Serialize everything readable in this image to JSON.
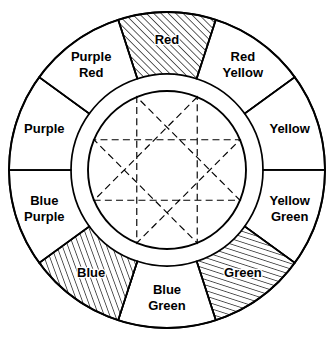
{
  "figure": {
    "name": "color-wheel",
    "geometry": {
      "center_x": 167,
      "center_y": 170,
      "outer_radius": 158,
      "ring_inner_radius": 96,
      "inner_circle_radius": 79,
      "segment_count": 8,
      "segment_span_degrees": 45,
      "first_segment_center_degrees": 90
    },
    "star": {
      "type": "star-polygon",
      "points": 8,
      "step": 3,
      "line_style": "dashed",
      "vertex_radius": 79,
      "vertex_angles_degrees": [
        67.5,
        112.5,
        157.5,
        202.5,
        247.5,
        292.5,
        337.5,
        22.5
      ]
    },
    "colors": {
      "stroke": "#000000",
      "fill": "#ffffff",
      "hatch": "#000000",
      "background": "#ffffff"
    }
  },
  "segments": [
    {
      "id": "red",
      "label": "Red",
      "lines": [
        "Red"
      ],
      "center_angle": 90,
      "hatched": true,
      "hatch_direction": "rising",
      "hatch_angle": 45,
      "hatch_spacing": 4
    },
    {
      "id": "red-yellow",
      "label": "Red Yellow",
      "lines": [
        "Red",
        "Yellow"
      ],
      "center_angle": 45,
      "hatched": false,
      "hatch_direction": "none",
      "hatch_angle": 0,
      "hatch_spacing": 0
    },
    {
      "id": "yellow",
      "label": "Yellow",
      "lines": [
        "Yellow"
      ],
      "center_angle": 0,
      "hatched": false,
      "hatch_direction": "none",
      "hatch_angle": 0,
      "hatch_spacing": 0
    },
    {
      "id": "yellow-green",
      "label": "Yellow Green",
      "lines": [
        "Yellow",
        "Green"
      ],
      "center_angle": 315,
      "hatched": false,
      "hatch_direction": "none",
      "hatch_angle": 0,
      "hatch_spacing": 0
    },
    {
      "id": "green",
      "label": "Green",
      "lines": [
        "Green"
      ],
      "center_angle": 270,
      "hatched": true,
      "hatch_direction": "rising",
      "hatch_angle": 72,
      "hatch_spacing": 4
    },
    {
      "id": "blue-green",
      "label": "Blue Green",
      "lines": [
        "Blue",
        "Green"
      ],
      "center_angle": 270,
      "hatched": false,
      "hatch_direction": "none",
      "hatch_angle": 0,
      "hatch_spacing": 0
    },
    {
      "id": "blue",
      "label": "Blue",
      "lines": [
        "Blue"
      ],
      "center_angle": 225,
      "hatched": true,
      "hatch_direction": "rising",
      "hatch_angle": 20,
      "hatch_spacing": 4
    },
    {
      "id": "blue-purple",
      "label": "Blue Purple",
      "lines": [
        "Blue",
        "Purple"
      ],
      "center_angle": 202.5,
      "hatched": false,
      "hatch_direction": "none",
      "hatch_angle": 0,
      "hatch_spacing": 0
    },
    {
      "id": "purple",
      "label": "Purple",
      "lines": [
        "Purple"
      ],
      "center_angle": 157.5,
      "hatched": false,
      "hatch_direction": "none",
      "hatch_angle": 0,
      "hatch_spacing": 0
    },
    {
      "id": "purple-red",
      "label": "Purple Red",
      "lines": [
        "Purple",
        "Red"
      ],
      "center_angle": 135,
      "hatched": false,
      "hatch_direction": "none",
      "hatch_angle": 0,
      "hatch_spacing": 0
    }
  ],
  "ring_order": [
    "red",
    "red-yellow",
    "yellow",
    "yellow-green",
    "green",
    "blue-green",
    "blue",
    "blue-purple",
    "purple",
    "purple-red"
  ],
  "labels": {
    "red": {
      "lines": [
        "Red"
      ]
    },
    "red_yellow": {
      "lines": [
        "Red",
        "Yellow"
      ]
    },
    "yellow": {
      "lines": [
        "Yellow"
      ]
    },
    "yellow_green": {
      "lines": [
        "Yellow",
        "Green"
      ]
    },
    "green": {
      "lines": [
        "Green"
      ]
    },
    "blue_green": {
      "lines": [
        "Blue",
        "Green"
      ]
    },
    "blue": {
      "lines": [
        "Blue"
      ]
    },
    "blue_purple": {
      "lines": [
        "Blue",
        "Purple"
      ]
    },
    "purple": {
      "lines": [
        "Purple"
      ]
    },
    "purple_red": {
      "lines": [
        "Purple",
        "Red"
      ]
    }
  }
}
